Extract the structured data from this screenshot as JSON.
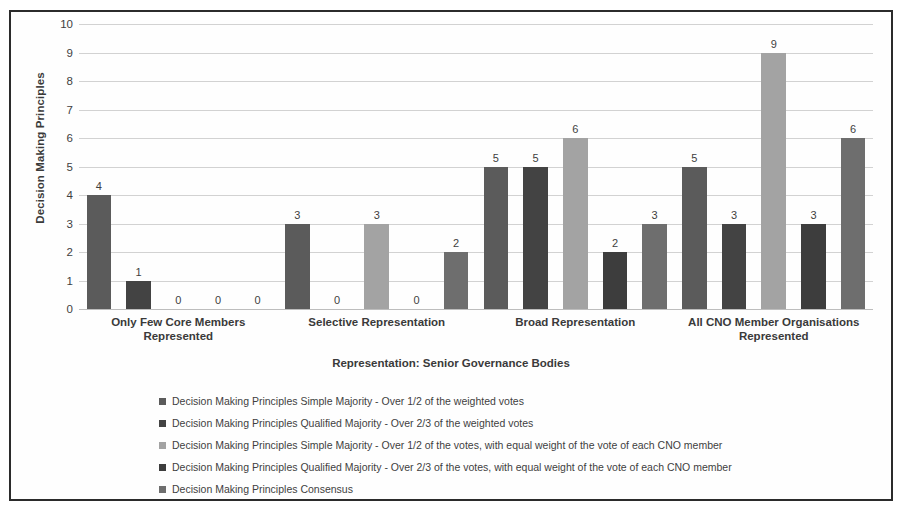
{
  "chart_data": {
    "type": "bar",
    "title": "",
    "xlabel": "Representation: Senior Governance Bodies",
    "ylabel": "Decision Making Principles",
    "ylim": [
      0,
      10
    ],
    "ytick_labels": [
      "0",
      "1",
      "2",
      "3",
      "4",
      "5",
      "6",
      "7",
      "8",
      "9",
      "10"
    ],
    "grid": true,
    "legend_position": "bottom",
    "categories": [
      "Only Few Core Members Represented",
      "Selective Representation",
      "Broad Representation",
      "All CNO Member Organisations Represented"
    ],
    "series": [
      {
        "name": "Decision Making Principles Simple Majority - Over 1/2 of the weighted votes",
        "color": "#5b5b5b",
        "values": [
          4,
          3,
          5,
          5
        ]
      },
      {
        "name": "Decision Making Principles Qualified Majority - Over 2/3 of the weighted votes",
        "color": "#434343",
        "values": [
          1,
          0,
          5,
          3
        ]
      },
      {
        "name": "Decision Making Principles Simple Majority - Over 1/2 of the votes, with equal weight of the vote of each CNO member",
        "color": "#a3a3a3",
        "values": [
          0,
          3,
          6,
          9
        ]
      },
      {
        "name": "Decision Making Principles Qualified Majority - Over 2/3 of the votes, with equal weight of the vote of each CNO member",
        "color": "#3d3d3d",
        "values": [
          0,
          0,
          2,
          3
        ]
      },
      {
        "name": "Decision Making Principles Consensus",
        "color": "#6e6e6e",
        "values": [
          0,
          2,
          3,
          6
        ]
      }
    ]
  },
  "frame": {
    "border_color": "#2b2b2b",
    "background": "#fefefe"
  }
}
